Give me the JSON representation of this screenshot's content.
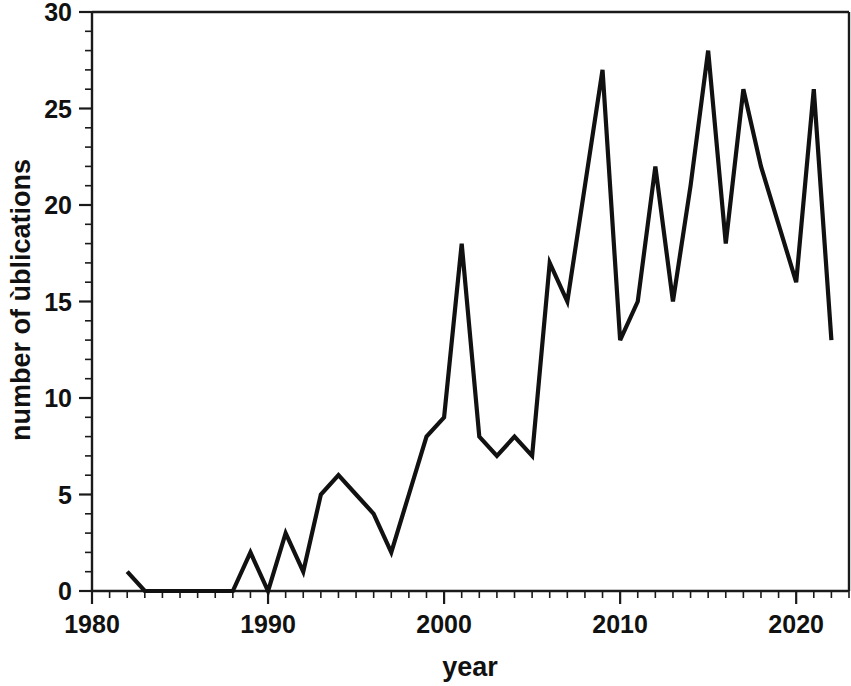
{
  "chart_data": {
    "type": "line",
    "title": "",
    "xlabel": "year",
    "ylabel": "number of ùblications",
    "xlim": [
      1980,
      2023
    ],
    "ylim": [
      0,
      30
    ],
    "grid": false,
    "legend": null,
    "x_tick_labels": [
      "1980",
      "1990",
      "2000",
      "2010",
      "2020"
    ],
    "x_tick_values": [
      1980,
      1990,
      2000,
      2010,
      2020
    ],
    "x_minor_tick_step": 1,
    "y_tick_labels": [
      "0",
      "5",
      "10",
      "15",
      "20",
      "25",
      "30"
    ],
    "y_tick_values": [
      0,
      5,
      10,
      15,
      20,
      25,
      30
    ],
    "y_minor_tick_step": 1,
    "line_color": "#111111",
    "x": [
      1982,
      1983,
      1984,
      1985,
      1986,
      1987,
      1988,
      1989,
      1990,
      1991,
      1992,
      1993,
      1994,
      1995,
      1996,
      1997,
      1998,
      1999,
      2000,
      2001,
      2002,
      2003,
      2004,
      2005,
      2006,
      2007,
      2008,
      2009,
      2010,
      2011,
      2012,
      2013,
      2014,
      2015,
      2016,
      2017,
      2018,
      2019,
      2020,
      2021,
      2022
    ],
    "values": [
      1,
      0,
      0,
      0,
      0,
      0,
      0,
      2,
      0,
      3,
      1,
      5,
      6,
      5,
      4,
      2,
      5,
      8,
      9,
      18,
      8,
      7,
      8,
      7,
      17,
      15,
      21,
      27,
      13,
      15,
      22,
      15,
      21,
      28,
      18,
      26,
      22,
      19,
      16,
      26,
      13
    ]
  },
  "axes": {
    "x_axis_title": "year",
    "y_axis_title": "number of ùblications"
  }
}
